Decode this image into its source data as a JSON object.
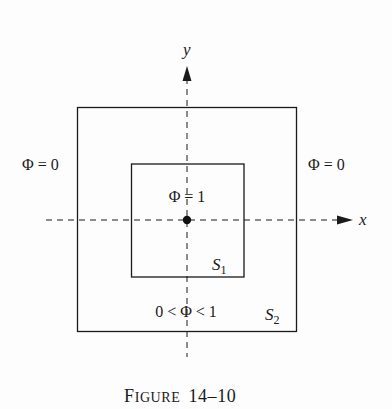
{
  "figure": {
    "caption_prefix": "F",
    "caption_rest": "IGURE",
    "caption_number": "14–10",
    "colors": {
      "ink": "#1a1a1a",
      "background": "#fdfdfd"
    }
  },
  "axes": {
    "x_label": "x",
    "y_label": "y"
  },
  "regions": {
    "outer_left_label": "Φ = 0",
    "outer_right_label": "Φ = 0",
    "inner_label": "Φ = 1",
    "between_label": "0 < Φ < 1"
  },
  "surfaces": {
    "inner": {
      "letter": "S",
      "subscript": "1"
    },
    "outer": {
      "letter": "S",
      "subscript": "2"
    }
  }
}
